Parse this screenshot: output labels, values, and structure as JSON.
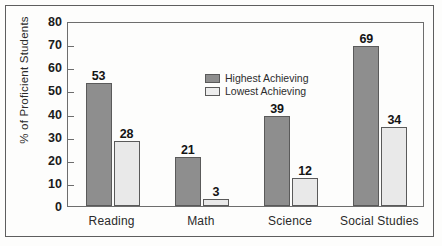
{
  "chart_data": {
    "type": "bar",
    "title": "",
    "subtitle": "",
    "xlabel": "",
    "ylabel": "% of Proficient Students",
    "categories": [
      "Reading",
      "Math",
      "Science",
      "Social Studies"
    ],
    "series": [
      {
        "name": "Highest Achieving",
        "color": "#8e8e8e",
        "values": [
          53,
          21,
          39,
          69
        ]
      },
      {
        "name": "Lowest Achieving",
        "color": "#e9e9e9",
        "values": [
          28,
          3,
          12,
          34
        ]
      }
    ],
    "ylim": [
      0,
      80
    ],
    "ytick_step": 10,
    "yticks": [
      "0",
      "10",
      "20",
      "30",
      "40",
      "50",
      "60",
      "70",
      "80"
    ],
    "grid": false,
    "legend_position": "top-left-inside",
    "data_labels_shown": true
  },
  "legend": {
    "entries": [
      {
        "label": "Highest Achieving",
        "swatch": "dark-gray-swatch"
      },
      {
        "label": "Lowest Achieving",
        "swatch": "light-gray-swatch"
      }
    ]
  },
  "colors": {
    "highest_achieving": "#8e8e8e",
    "lowest_achieving": "#e9e9e9",
    "axis": "#6d6d6d",
    "frame": "#5e5e5e",
    "text": "#1b1b1b",
    "background": "#fdfdfc"
  }
}
